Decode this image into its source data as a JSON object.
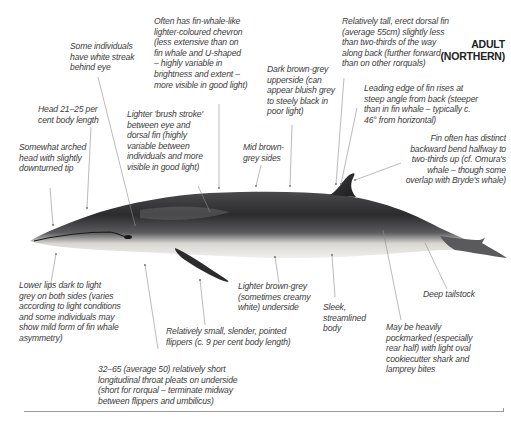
{
  "figure": {
    "title_line1": "ADULT",
    "title_line2": "(NORTHERN)",
    "colors": {
      "background": "#ffffff",
      "text": "#3b3b3b",
      "leader_lines": "#8a8a8a",
      "whale_dark": "#2a2a2c",
      "whale_mid": "#6a6a6c",
      "whale_belly": "#e8e6e2"
    }
  },
  "annotations": {
    "white_streak": "Some individuals\nhave white streak\nbehind eye",
    "chevron": "Often has fin-whale-like\nlighter-coloured chevron\n(less extensive than on\nfin whale and U-shaped\n– highly variable in\nbrightness and extent –\nmore visible in good light)",
    "dorsal_fin": "Relatively tall, erect dorsal fin\n(average 55cm) slightly less\nthan two-thirds of the way\nalong back (further forward\nthan on other rorquals)",
    "head_length": "Head 21–25 per\ncent body length",
    "brush_stroke": "Lighter 'brush stroke'\nbetween eye and\ndorsal fin (highly\nvariable between\nindividuals and more\nvisible in good light)",
    "upperside": "Dark brown-grey\nupperside (can\nappear bluish grey\nto steely black in\npoor light)",
    "leading_edge": "Leading edge of fin rises at\nsteep angle from back (steeper\nthan in fin whale – typically c.\n46° from horizontal)",
    "arched_head": "Somewhat arched\nhead with slightly\ndownturned tip",
    "sides": "Mid brown-\ngrey sides",
    "fin_bend": "Fin often has distinct\nbackward bend halfway to\ntwo-thirds up (cf. Omura's\nwhale – though some\noverlap with Bryde's whale)",
    "lower_lips": "Lower lips dark to light\ngrey on both sides (varies\naccording to light conditions\nand some individuals may\nshow mild form of fin whale\nasymmetry)",
    "underside": "Lighter brown-grey\n(sometimes creamy\nwhite) underside",
    "tailstock": "Deep tailstock",
    "sleek_body": "Sleek,\nstreamlined\nbody",
    "flippers": "Relatively small, slender, pointed\nflippers (c. 9 per cent body length)",
    "pockmarked": "May be heavily\npockmarked (especially\nrear half) with light oval\ncookiecutter shark and\nlamprey bites",
    "throat_pleats": "32–65 (average 50) relatively short\nlongitudinal throat pleats on underside\n(short for rorqual – terminate midway\nbetween flippers and umbilicus)"
  }
}
